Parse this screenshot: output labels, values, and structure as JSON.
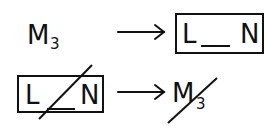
{
  "diagram": {
    "row1": {
      "source": {
        "symbol": "M",
        "subscript": "3"
      },
      "arrow": "→",
      "target": {
        "left": "L",
        "blank": "__",
        "right": "N",
        "boxed": true,
        "crossed_out": false
      }
    },
    "row2": {
      "source": {
        "left": "L",
        "blank": "__",
        "right": "N",
        "boxed": true,
        "crossed_out": true
      },
      "arrow": "→",
      "target": {
        "symbol": "M",
        "subscript": "3",
        "crossed_out": true
      }
    },
    "colors": {
      "ink": "#111111",
      "background": "#ffffff"
    }
  }
}
